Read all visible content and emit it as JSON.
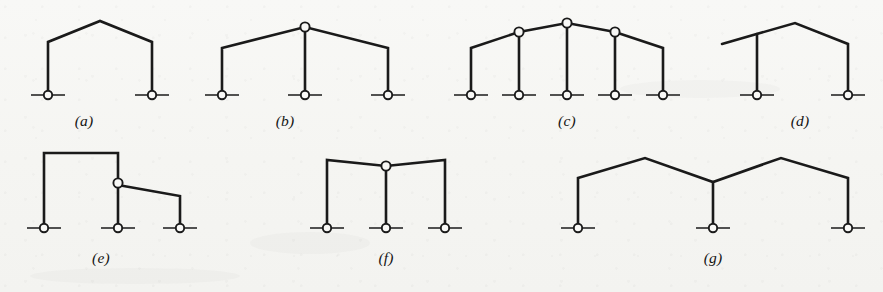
{
  "figure": {
    "background_color": "#f7f7f5",
    "line_color": "#1a1a1a",
    "width": 883,
    "height": 292
  },
  "frames": [
    {
      "id": "frame-a",
      "label": "(a)",
      "label_x": 84,
      "label_y": 126,
      "description": "single-bay gable frame, two pinned supports, no internal hinges",
      "member_path": "M 48,95 L 48,42 L 100,21 L 152,42 L 152,95",
      "supports": [
        {
          "cx": 48,
          "cy": 95
        },
        {
          "cx": 152,
          "cy": 95
        }
      ],
      "hinges": []
    },
    {
      "id": "frame-b",
      "label": "(b)",
      "label_x": 285,
      "label_y": 126,
      "description": "two-bay gable frame, three pinned supports, hinge at apex above middle column",
      "member_path": "M 222,95 L 222,48 L 305,27 L 388,48 L 388,95",
      "columns": [
        "M 305,95 L 305,27"
      ],
      "supports": [
        {
          "cx": 222,
          "cy": 95
        },
        {
          "cx": 305,
          "cy": 95
        },
        {
          "cx": 388,
          "cy": 95
        }
      ],
      "hinges": [
        {
          "cx": 305,
          "cy": 27
        }
      ]
    },
    {
      "id": "frame-c",
      "label": "(c)",
      "label_x": 567,
      "label_y": 126,
      "description": "four-bay gable frame, five pinned supports, hinges atop the three interior columns",
      "member_path": "M 471,95 L 471,48 L 519,32 L 567,23 L 615,32 L 663,48 L 663,95",
      "columns": [
        "M 519,95 L 519,32",
        "M 567,95 L 567,23",
        "M 615,95 L 615,32"
      ],
      "supports": [
        {
          "cx": 471,
          "cy": 95
        },
        {
          "cx": 519,
          "cy": 95
        },
        {
          "cx": 567,
          "cy": 95
        },
        {
          "cx": 615,
          "cy": 95
        },
        {
          "cx": 663,
          "cy": 95
        }
      ],
      "hinges": [
        {
          "cx": 519,
          "cy": 32
        },
        {
          "cx": 567,
          "cy": 23
        },
        {
          "cx": 615,
          "cy": 32
        }
      ]
    },
    {
      "id": "frame-d",
      "label": "(d)",
      "label_x": 800,
      "label_y": 126,
      "description": "single-bay gable frame with cantilever overhang on the left rafter",
      "member_path": "M 722,44 L 795,23 L 848,44 L 848,95",
      "columns": [
        "M 757,95 L 757,34"
      ],
      "supports": [
        {
          "cx": 757,
          "cy": 95
        },
        {
          "cx": 848,
          "cy": 95
        }
      ],
      "hinges": []
    },
    {
      "id": "frame-e",
      "label": "(e)",
      "label_x": 101,
      "label_y": 263,
      "description": "stepped two-bay frame, tall left bay and lower right bay, hinge on middle column",
      "member_path": "M 44,228 L 44,153 L 118,153 L 118,228",
      "columns": [
        "M 118,185 L 180,196 L 180,228"
      ],
      "supports": [
        {
          "cx": 44,
          "cy": 228
        },
        {
          "cx": 118,
          "cy": 228
        },
        {
          "cx": 180,
          "cy": 228
        }
      ],
      "hinges": [
        {
          "cx": 118,
          "cy": 183
        }
      ]
    },
    {
      "id": "frame-f",
      "label": "(f)",
      "label_x": 386,
      "label_y": 263,
      "description": "two-bay frame with shallow peak, three pinned supports, hinge atop middle column",
      "member_path": "M 327,228 L 327,160 L 386,166 L 445,160 L 445,228",
      "columns": [
        "M 386,228 L 386,166"
      ],
      "supports": [
        {
          "cx": 327,
          "cy": 228
        },
        {
          "cx": 386,
          "cy": 228
        },
        {
          "cx": 445,
          "cy": 228
        }
      ],
      "hinges": [
        {
          "cx": 386,
          "cy": 166
        }
      ]
    },
    {
      "id": "frame-g",
      "label": "(g)",
      "label_x": 713,
      "label_y": 263,
      "description": "two-bay double-gable frame with central valley, three pinned supports, rigid joints",
      "member_path": "M 578,228 L 578,178 L 645,158 L 713,182 L 781,158 L 848,178 L 848,228",
      "columns": [
        "M 713,228 L 713,182"
      ],
      "supports": [
        {
          "cx": 578,
          "cy": 228
        },
        {
          "cx": 713,
          "cy": 228
        },
        {
          "cx": 848,
          "cy": 228
        }
      ],
      "hinges": []
    }
  ],
  "geometry": {
    "support_radius": 4.2,
    "hinge_radius": 4.6,
    "ground_half_width": 17
  }
}
